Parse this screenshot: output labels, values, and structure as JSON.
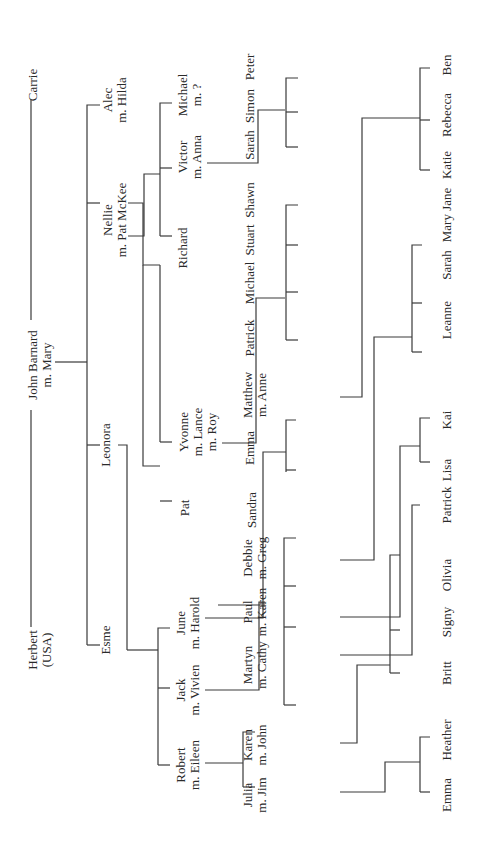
{
  "people": {
    "herbert": [
      "Herbert",
      "(USA)"
    ],
    "john": [
      "John Barnard",
      "m. Mary"
    ],
    "carrie": [
      "Carrie"
    ],
    "esme": [
      "Esme"
    ],
    "leonora": [
      "Leonora"
    ],
    "nellie": [
      "Nellie",
      "m. Pat McKee"
    ],
    "alec": [
      "Alec",
      "m. Hilda"
    ],
    "robert": [
      "Robert",
      "m. Eileen"
    ],
    "jack": [
      "Jack",
      "m. Vivien"
    ],
    "june": [
      "June",
      "m. Harold"
    ],
    "pat": [
      "Pat"
    ],
    "yvonne": [
      "Yvonne",
      "m. Lance",
      "m. Roy"
    ],
    "richard": [
      "Richard"
    ],
    "victor": [
      "Victor",
      "m. Anna"
    ],
    "michael": [
      "Michael",
      "m. ?"
    ],
    "julia": [
      "Julia",
      "m. Jim"
    ],
    "karen": [
      "Karen",
      "m. John"
    ],
    "martyn": [
      "Martyn",
      "m. Cathy"
    ],
    "paul": [
      "Paul",
      "m. Karen"
    ],
    "debbie": [
      "Debbie",
      "m. Greg"
    ],
    "sandra": [
      "Sandra"
    ],
    "emma1": [
      "Emma"
    ],
    "matthew": [
      "Matthew",
      "m. Anne"
    ],
    "patrick1": [
      "Patrick"
    ],
    "michael2": [
      "Michael"
    ],
    "stuart": [
      "Stuart"
    ],
    "shawn": [
      "Shawn"
    ],
    "sarah1": [
      "Sarah"
    ],
    "simon": [
      "Simon"
    ],
    "peter": [
      "Peter"
    ],
    "emma2": [
      "Emma"
    ],
    "heather": [
      "Heather"
    ],
    "britt": [
      "Britt"
    ],
    "signy": [
      "Signy"
    ],
    "olivia": [
      "Olivia"
    ],
    "patrick2": [
      "Patrick"
    ],
    "lisa": [
      "Lisa"
    ],
    "kai": [
      "Kai"
    ],
    "leanne": [
      "Leanne"
    ],
    "sarah2": [
      "Sarah"
    ],
    "maryjane": [
      "Mary Jane"
    ],
    "katie": [
      "Katie"
    ],
    "rebecca": [
      "Rebecca"
    ],
    "ben": [
      "Ben"
    ]
  }
}
